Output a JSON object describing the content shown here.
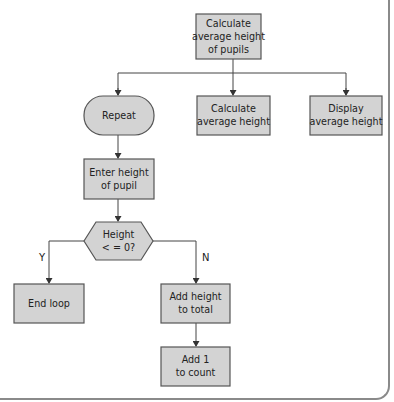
{
  "diagram": {
    "type": "flowchart",
    "colors": {
      "node_fill": "#d3d3d3",
      "node_stroke": "#555555",
      "line": "#444444",
      "frame": "#8a8a8a"
    },
    "nodes": [
      {
        "id": "root",
        "shape": "rect",
        "lines": [
          "Calculate",
          "average height",
          "of pupils"
        ]
      },
      {
        "id": "repeat",
        "shape": "terminator",
        "lines": [
          "Repeat"
        ]
      },
      {
        "id": "calc",
        "shape": "rect",
        "lines": [
          "Calculate",
          "average height"
        ]
      },
      {
        "id": "display",
        "shape": "rect",
        "lines": [
          "Display",
          "average height"
        ]
      },
      {
        "id": "enter",
        "shape": "rect",
        "lines": [
          "Enter height",
          "of pupil"
        ]
      },
      {
        "id": "decision",
        "shape": "hexagon",
        "lines": [
          "Height",
          "< = 0?"
        ]
      },
      {
        "id": "endloop",
        "shape": "rect",
        "lines": [
          "End loop"
        ]
      },
      {
        "id": "addheight",
        "shape": "rect",
        "lines": [
          "Add height",
          "to total"
        ]
      },
      {
        "id": "addone",
        "shape": "rect",
        "lines": [
          "Add 1",
          "to count"
        ]
      }
    ],
    "edge_labels": {
      "yes": "Y",
      "no": "N"
    }
  }
}
